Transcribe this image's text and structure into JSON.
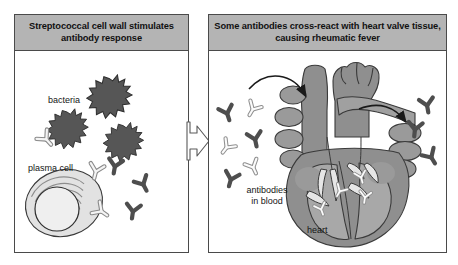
{
  "figure": {
    "type": "two-panel-medical-diagram",
    "background_color": "#ffffff",
    "title_bar_color": "#b4b4b4",
    "border_color": "#4a4a4a"
  },
  "panels": [
    {
      "id": "left",
      "title": "Streptococcal cell wall\nstimulates antibody response",
      "labels": {
        "bacteria": "bacteria",
        "plasma_cell": "plasma cell"
      },
      "elements": {
        "bacteria_count": 3,
        "bacteria_color": "#565656",
        "antibody_dark_color": "#4e4e4e",
        "antibody_light_color": "#f2f2f2",
        "plasma_cell_color": "#dedede"
      }
    },
    {
      "id": "right",
      "title": "Some antibodies cross-react with heart valve tissue,\ncausing rheumatic fever",
      "labels": {
        "antibodies_in_blood": "antibodies\nin blood",
        "heart": "heart"
      },
      "elements": {
        "heart_body_color": "#8f8f8f",
        "heart_chamber_color": "#a8a8a8",
        "valve_color": "#e3e3e3",
        "antibody_dark_color": "#4e4e4e",
        "antibody_light_color": "#f2f2f2",
        "arrow_color": "#1a1a1a"
      }
    }
  ],
  "connector": {
    "name": "block-arrow",
    "direction": "left-to-right",
    "fill": "#ffffff",
    "stroke": "#5a5a5a"
  }
}
